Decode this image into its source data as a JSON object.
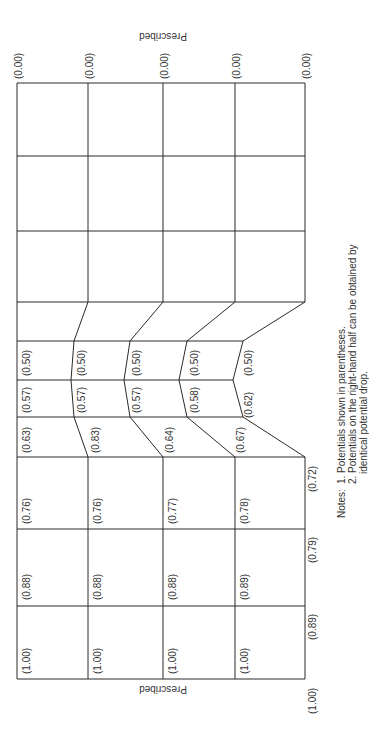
{
  "diagram": {
    "boundary_labels": {
      "top": "Prescribed",
      "bottom": "Prescribed"
    },
    "top_edge_values": [
      "(0.00)",
      "(0.00)",
      "(0.00)",
      "(0.00)",
      "(0.00)"
    ],
    "right_edge_values": [
      "(1.00)",
      "(0.89)",
      "(0.79)",
      "(0.72)"
    ],
    "rows": [
      {
        "values": [
          "(1.00)",
          "(0.88)",
          "(0.76)",
          "(0.63)",
          "(0.57)",
          "(0.50)"
        ]
      },
      {
        "values": [
          "(1.00)",
          "(0.88)",
          "(0.76)",
          "(0.83)",
          "(0.57)",
          "(0.50)"
        ]
      },
      {
        "values": [
          "(1.00)",
          "(0.88)",
          "(0.77)",
          "(0.64)",
          "(0.57)",
          "(0.50)"
        ]
      },
      {
        "values": [
          "(1.00)",
          "(0.89)",
          "(0.78)",
          "(0.67)",
          "(0.58)",
          "(0.50)"
        ]
      },
      {
        "values": [
          "(0.62)",
          "(0.50)"
        ]
      }
    ],
    "notes": {
      "heading": "Notes:",
      "items": [
        "1. Potentials shown in parentheses.",
        "2. Potentials on the right-hand half can be obtained by",
        "identical potential drop."
      ]
    },
    "colors": {
      "line": "#2a2a2a",
      "text": "#333333",
      "background": "#ffffff"
    }
  }
}
